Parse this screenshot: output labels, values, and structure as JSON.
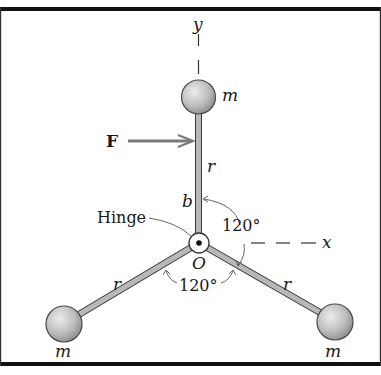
{
  "figure": {
    "labels": {
      "y_axis": "y",
      "x_axis": "x",
      "mass_top": "m",
      "mass_left": "m",
      "mass_right": "m",
      "force": "F",
      "rod_top": "r",
      "rod_left": "r",
      "rod_right": "r",
      "distance_b": "b",
      "hinge": "Hinge",
      "origin": "O",
      "angle_upper": "120°",
      "angle_lower": "120°"
    },
    "colors": {
      "frame": "#111111",
      "rod_fill": "#b8b8b8",
      "rod_edge": "#3a3a3a",
      "ball_light": "#e6e6e6",
      "ball_dark": "#8a8a8a",
      "force_arrow": "#7a7a7a",
      "text": "#1a1a1a"
    }
  }
}
